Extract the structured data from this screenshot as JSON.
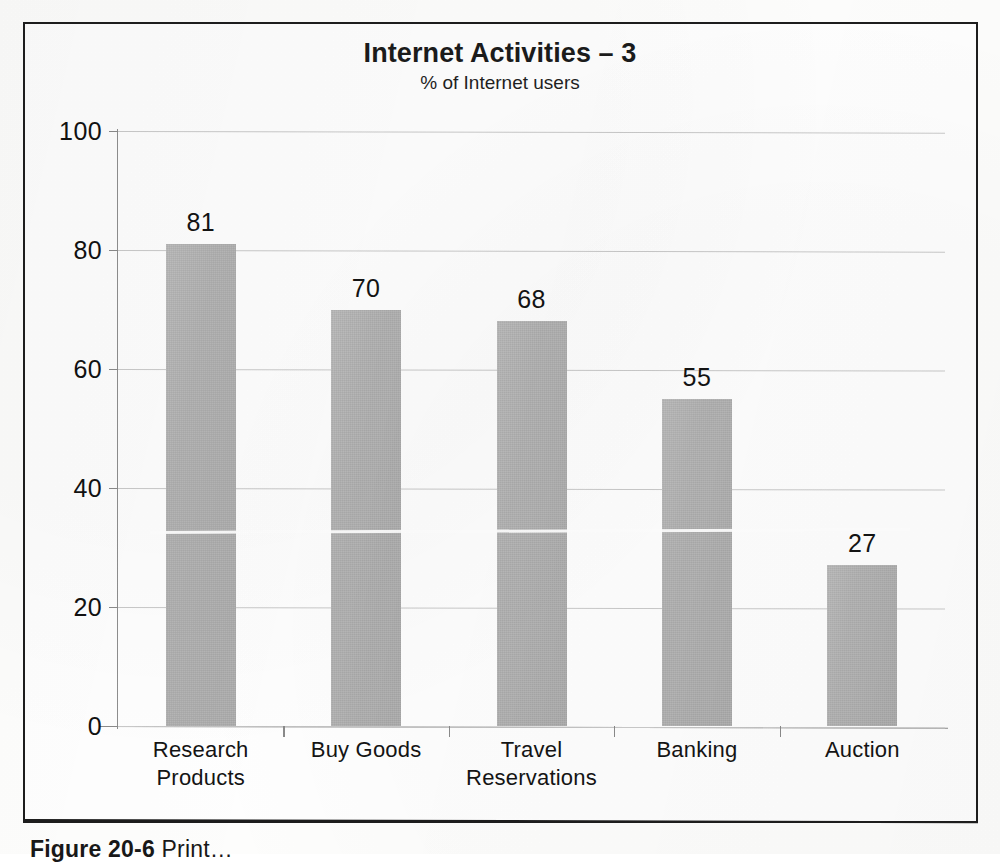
{
  "chart_data": {
    "type": "bar",
    "title": "Internet Activities – 3",
    "subtitle": "% of Internet users",
    "xlabel": "",
    "ylabel": "",
    "ylim": [
      0,
      100
    ],
    "yticks": [
      0,
      20,
      40,
      60,
      80,
      100
    ],
    "ytick_labels": [
      "0",
      "20",
      "40",
      "60",
      "80",
      "100"
    ],
    "grid": true,
    "legend": "none",
    "data_labels": true,
    "bar_color": "#b3b3b3",
    "categories": [
      "Research\nProducts",
      "Buy Goods",
      "Travel\nReservations",
      "Banking",
      "Auction"
    ],
    "values": [
      81,
      70,
      68,
      55,
      27
    ],
    "value_labels": [
      "81",
      "70",
      "68",
      "55",
      "27"
    ]
  },
  "figure": {
    "caption_label": "Figure 20-6",
    "caption_rest": "  Print…"
  },
  "colors": {
    "frame": "#1d1d1d",
    "gridline": "#c9c9c9",
    "axis": "#8a8a8a",
    "bar": "#b3b3b3",
    "text": "#131313",
    "paper": "#fdfdfc"
  }
}
